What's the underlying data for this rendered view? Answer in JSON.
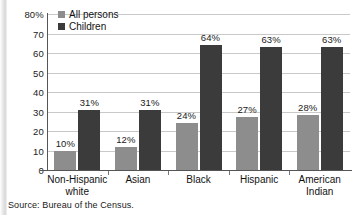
{
  "chart_data": {
    "type": "bar",
    "title": "",
    "xlabel": "",
    "ylabel": "",
    "ylim": [
      0,
      80
    ],
    "grid": true,
    "legend_position": "top-left-inside",
    "categories": [
      "Non-Hispanic white",
      "Asian",
      "Black",
      "Hispanic",
      "American Indian"
    ],
    "category_lines": [
      [
        "Non-Hispanic",
        "white"
      ],
      [
        "Asian"
      ],
      [
        "Black"
      ],
      [
        "Hispanic"
      ],
      [
        "American",
        "Indian"
      ]
    ],
    "series": [
      {
        "name": "All persons",
        "color": "#8d8d8d",
        "values": [
          10,
          12,
          24,
          27,
          28
        ],
        "labels": [
          "10%",
          "12%",
          "24%",
          "27%",
          "28%"
        ]
      },
      {
        "name": "Children",
        "color": "#3b3b3b",
        "values": [
          31,
          31,
          64,
          63,
          63
        ],
        "labels": [
          "31%",
          "31%",
          "64%",
          "63%",
          "63%"
        ]
      }
    ],
    "y_ticks": [
      80,
      70,
      60,
      50,
      40,
      30,
      20,
      10,
      0
    ],
    "y_tick_labels": [
      "80%",
      "70",
      "60",
      "50",
      "40",
      "30",
      "20",
      "10",
      "0"
    ]
  },
  "legend": {
    "items": [
      {
        "label": "All persons",
        "color": "#8d8d8d"
      },
      {
        "label": "Children",
        "color": "#3b3b3b"
      }
    ]
  },
  "source": {
    "text": "Source: Bureau of the Census."
  }
}
